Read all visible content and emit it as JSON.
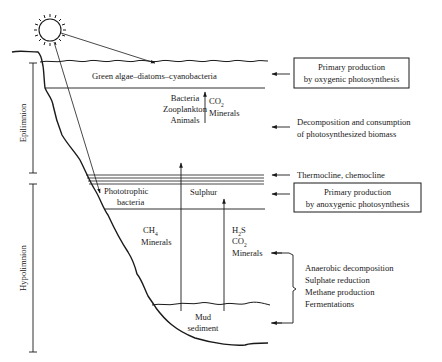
{
  "diagram": {
    "zones": {
      "epilimnion": "Epilimnion",
      "hypolimnion": "Hypolimnion"
    },
    "layers": {
      "surface_organisms": "Green algae–diatoms–cyanobacteria",
      "consumers": [
        "Bacteria",
        "Zooplankton",
        "Animals"
      ],
      "upper_products": {
        "co2": "CO",
        "co2_sub": "2",
        "minerals": "Minerals"
      },
      "phototrophic": [
        "Phototrophic",
        "bacteria"
      ],
      "sulphur": "Sulphur",
      "lower_left_products": {
        "ch4": "CH",
        "ch4_sub": "4",
        "minerals": "Minerals"
      },
      "lower_right_products": {
        "h2s_h": "H",
        "h2s_sub": "2",
        "h2s_s": "S",
        "co2": "CO",
        "co2_sub": "2",
        "minerals": "Minerals"
      },
      "sediment": [
        "Mud",
        "sediment"
      ]
    },
    "annotations": {
      "oxygenic_box": [
        "Primary production",
        "by oxygenic photosynthesis"
      ],
      "decomposition": [
        "Decomposition and consumption",
        "of photosynthesized biomass"
      ],
      "thermocline": "Thermocline, chemocline",
      "anoxygenic_box": [
        "Primary production",
        "by anoxygenic photosynthesis"
      ],
      "anaerobic": [
        "Anaerobic decomposition",
        "Sulphate reduction",
        "Methane production",
        "Fermentations"
      ]
    },
    "icons": {
      "sun": "sun-icon"
    },
    "colors": {
      "ink": "#1a1a1a",
      "background": "#ffffff"
    }
  }
}
